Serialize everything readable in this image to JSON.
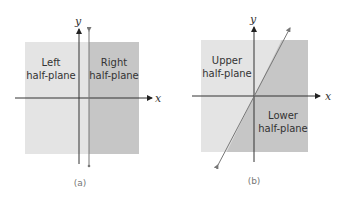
{
  "panels": [
    {
      "id": "a",
      "caption": "(a)",
      "x_label": "x",
      "y_label": "y",
      "regions": [
        {
          "line1": "Left",
          "line2": "half-plane",
          "color": "#e4e4e4"
        },
        {
          "line1": "Right",
          "line2": "half-plane",
          "color": "#c6c6c6"
        }
      ],
      "divider": "vertical line x = c (c > 0)"
    },
    {
      "id": "b",
      "caption": "(b)",
      "x_label": "x",
      "y_label": "y",
      "regions": [
        {
          "line1": "Upper",
          "line2": "half-plane",
          "color": "#e4e4e4"
        },
        {
          "line1": "Lower",
          "line2": "half-plane",
          "color": "#c6c6c6"
        }
      ],
      "divider": "line through origin with positive slope"
    }
  ],
  "colors": {
    "axis": "#333333",
    "divider": "#666666"
  }
}
